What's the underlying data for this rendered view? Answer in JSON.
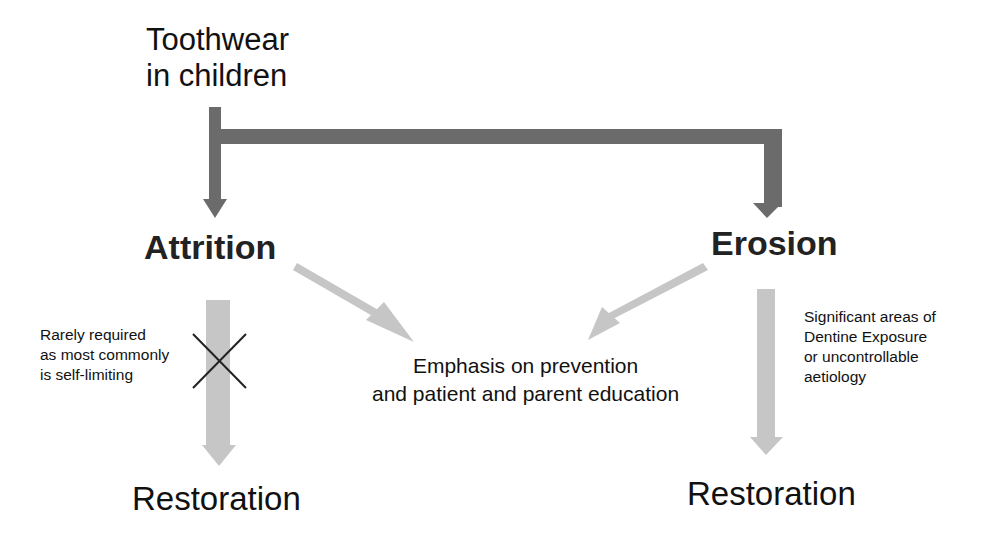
{
  "diagram": {
    "root": {
      "lines": [
        "Toothwear",
        "in children"
      ]
    },
    "branches": [
      {
        "id": "attrition",
        "label": "Attrition",
        "note": [
          "Rarely required",
          "as most commonly",
          "is self-limiting"
        ],
        "note_marker": "crossed-out",
        "outcome": "Restoration"
      },
      {
        "id": "erosion",
        "label": "Erosion",
        "note": [
          "Significant areas of",
          "Dentine Exposure",
          "or uncontrollable",
          "aetiology"
        ],
        "outcome": "Restoration"
      }
    ],
    "shared_outcome": {
      "lines": [
        "Emphasis on prevention",
        "and patient and parent education"
      ]
    }
  },
  "colors": {
    "dark_arrow": "#6b6b6b",
    "light_arrow": "#c6c6c6",
    "cross": "#222222",
    "text": "#111111"
  }
}
